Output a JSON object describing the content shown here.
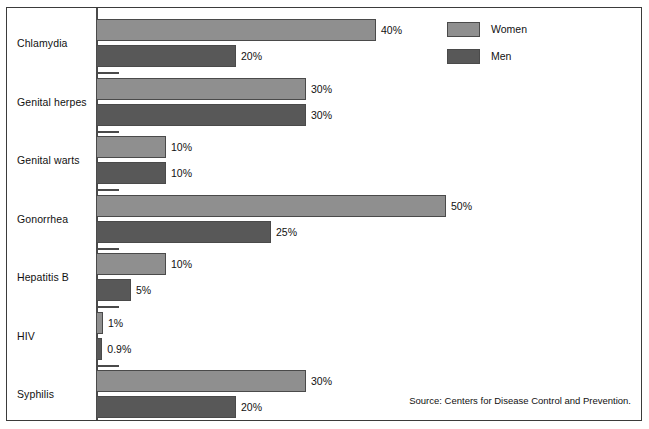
{
  "chart_data": {
    "type": "bar",
    "orientation": "horizontal",
    "title": "",
    "xlabel": "",
    "ylabel": "",
    "grid": false,
    "xlim": [
      0,
      50
    ],
    "categories": [
      "Chlamydia",
      "Genital herpes",
      "Genital warts",
      "Gonorrhea",
      "Hepatitis B",
      "HIV",
      "Syphilis"
    ],
    "series": [
      {
        "name": "Women",
        "color": "#8f8f8f",
        "values": [
          40,
          30,
          10,
          50,
          10,
          1,
          30
        ],
        "labels": [
          "40%",
          "30%",
          "10%",
          "50%",
          "10%",
          "1%",
          "30%"
        ]
      },
      {
        "name": "Men",
        "color": "#585858",
        "values": [
          20,
          30,
          10,
          25,
          5,
          0.9,
          20
        ],
        "labels": [
          "20%",
          "30%",
          "10%",
          "25%",
          "5%",
          "0.9%",
          "20%"
        ]
      }
    ],
    "legend": {
      "position": "top-right",
      "entries": [
        {
          "label": "Women",
          "color": "#8f8f8f"
        },
        {
          "label": "Men",
          "color": "#585858"
        }
      ]
    },
    "source": "Source: Centers for Disease Control and Prevention."
  }
}
